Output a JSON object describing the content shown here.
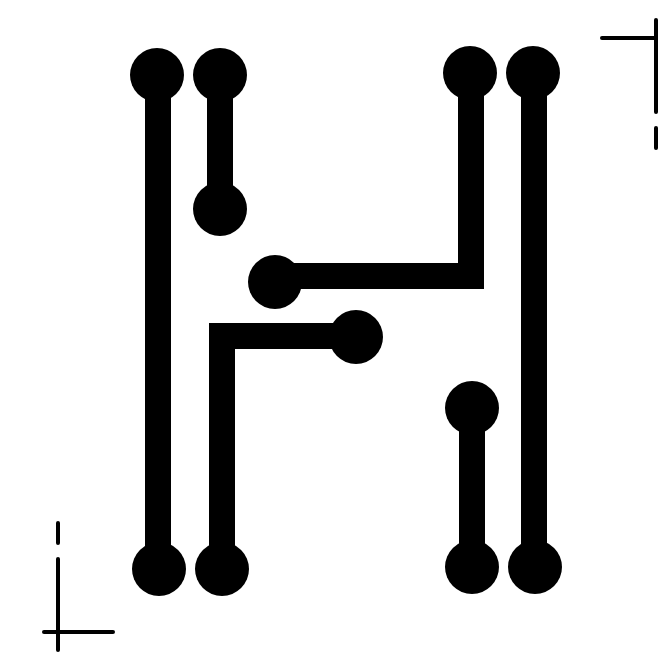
{
  "figure": {
    "width": 658,
    "height": 653,
    "colors": {
      "background": "#ffffff",
      "ink": "#000000"
    },
    "trace_width": 26,
    "pad_radius": 27
  },
  "traces": [
    {
      "id": "trace-left-outer",
      "description": "long vertical trace, left outer",
      "points": [
        [
          158,
          75
        ],
        [
          158,
          569
        ]
      ],
      "pads": [
        [
          157,
          75
        ],
        [
          159,
          569
        ]
      ]
    },
    {
      "id": "trace-left-short",
      "description": "short vertical trace, upper left",
      "points": [
        [
          220,
          75
        ],
        [
          220,
          209
        ]
      ],
      "pads": [
        [
          220,
          75
        ],
        [
          220,
          209
        ]
      ]
    },
    {
      "id": "trace-upper-bend",
      "description": "trace from upper-right pad down then left to middle pad",
      "points": [
        [
          471,
          73
        ],
        [
          471,
          276
        ],
        [
          275,
          276
        ]
      ],
      "pads": [
        [
          470,
          73
        ],
        [
          275,
          282
        ]
      ]
    },
    {
      "id": "trace-lower-bend",
      "description": "trace from middle pad left then down to lower-left pad",
      "points": [
        [
          356,
          336
        ],
        [
          222,
          336
        ],
        [
          222,
          569
        ]
      ],
      "pads": [
        [
          356,
          337
        ],
        [
          222,
          569
        ]
      ]
    },
    {
      "id": "trace-right-short",
      "description": "short vertical trace, lower right",
      "points": [
        [
          472,
          408
        ],
        [
          472,
          567
        ]
      ],
      "pads": [
        [
          472,
          408
        ],
        [
          472,
          567
        ]
      ]
    },
    {
      "id": "trace-right-outer",
      "description": "long vertical trace, right outer",
      "points": [
        [
          534,
          73
        ],
        [
          534,
          567
        ]
      ],
      "pads": [
        [
          533,
          73
        ],
        [
          535,
          567
        ]
      ]
    }
  ],
  "crop_marks": [
    {
      "id": "crop-mark-top-right",
      "lines": [
        [
          [
            602,
            38
          ],
          [
            658,
            38
          ]
        ],
        [
          [
            656,
            20
          ],
          [
            656,
            112
          ]
        ],
        [
          [
            656,
            128
          ],
          [
            656,
            148
          ]
        ]
      ]
    },
    {
      "id": "crop-mark-bottom-left",
      "lines": [
        [
          [
            58,
            523
          ],
          [
            58,
            543
          ]
        ],
        [
          [
            58,
            559
          ],
          [
            58,
            650
          ]
        ],
        [
          [
            44,
            632
          ],
          [
            113,
            632
          ]
        ]
      ]
    }
  ]
}
